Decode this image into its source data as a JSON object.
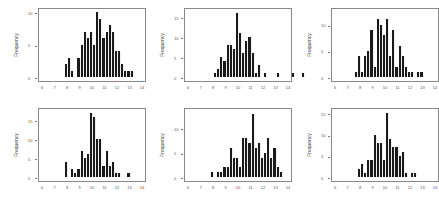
{
  "chart_data": [
    {
      "type": "bar",
      "title": "",
      "xlabel": "",
      "ylabel": "Frequency",
      "xlim": [
        6,
        14
      ],
      "ylim": [
        0,
        10.5
      ],
      "x_ticks": [
        "6",
        "7",
        "8",
        "9",
        "10",
        "11",
        "12",
        "13",
        "14"
      ],
      "y_ticks": [
        "0",
        "5",
        "10"
      ],
      "bin_width": 0.25,
      "bin_start": 7.75,
      "values": [
        2,
        3,
        1,
        0,
        3,
        5,
        7,
        6,
        7,
        5,
        10,
        9,
        6,
        7,
        8,
        7,
        4,
        4,
        2,
        1,
        1,
        1
      ],
      "grid": false
    },
    {
      "type": "bar",
      "title": "",
      "xlabel": "",
      "ylabel": "Frequency",
      "xlim": [
        6,
        14
      ],
      "ylim": [
        0,
        17
      ],
      "x_ticks": [
        "6",
        "7",
        "8",
        "9",
        "10",
        "11",
        "12",
        "13",
        "14"
      ],
      "y_ticks": [
        "0",
        "5",
        "10",
        "15"
      ],
      "bin_width": 0.25,
      "bin_start": 8.0,
      "values": [
        1,
        2,
        5,
        4,
        8,
        8,
        7,
        16,
        11,
        6,
        9,
        10,
        6,
        1,
        3,
        0,
        1,
        0,
        0,
        0,
        1,
        0,
        0,
        0,
        0,
        1,
        0,
        0,
        1
      ],
      "grid": false
    },
    {
      "type": "bar",
      "title": "",
      "xlabel": "",
      "ylabel": "Frequency",
      "xlim": [
        6,
        14
      ],
      "ylim": [
        0,
        13
      ],
      "x_ticks": [
        "6",
        "7",
        "8",
        "9",
        "10",
        "11",
        "12",
        "13",
        "14"
      ],
      "y_ticks": [
        "0",
        "5",
        "10"
      ],
      "bin_width": 0.25,
      "bin_start": 7.5,
      "values": [
        1,
        4,
        1,
        4,
        5,
        9,
        2,
        11,
        10,
        8,
        11,
        4,
        9,
        2,
        6,
        4,
        2,
        1,
        1,
        0,
        1,
        1
      ],
      "grid": false
    },
    {
      "type": "bar",
      "title": "",
      "xlabel": "",
      "ylabel": "Frequency",
      "xlim": [
        6,
        14
      ],
      "ylim": [
        0,
        18
      ],
      "x_ticks": [
        "6",
        "7",
        "8",
        "9",
        "10",
        "11",
        "12",
        "13",
        "14"
      ],
      "y_ticks": [
        "0",
        "5",
        "10",
        "15"
      ],
      "bin_width": 0.25,
      "bin_start": 7.75,
      "values": [
        4,
        0,
        2,
        1,
        2,
        7,
        5,
        6,
        17,
        16,
        10,
        10,
        3,
        7,
        3,
        4,
        1,
        1,
        0,
        0,
        1
      ],
      "grid": false
    },
    {
      "type": "bar",
      "title": "",
      "xlabel": "",
      "ylabel": "Frequency",
      "xlim": [
        6,
        14
      ],
      "ylim": [
        0,
        14
      ],
      "x_ticks": [
        "6",
        "7",
        "8",
        "9",
        "10",
        "11",
        "12",
        "13",
        "14"
      ],
      "y_ticks": [
        "0",
        "5",
        "10"
      ],
      "bin_width": 0.25,
      "bin_start": 7.75,
      "values": [
        1,
        0,
        1,
        1,
        2,
        2,
        6,
        4,
        4,
        2,
        8,
        8,
        7,
        13,
        6,
        7,
        4,
        5,
        8,
        4,
        6,
        2,
        1
      ],
      "grid": false
    },
    {
      "type": "bar",
      "title": "",
      "xlabel": "",
      "ylabel": "Frequency",
      "xlim": [
        6,
        14
      ],
      "ylim": [
        0,
        16
      ],
      "x_ticks": [
        "6",
        "7",
        "8",
        "9",
        "10",
        "11",
        "12",
        "13",
        "14"
      ],
      "y_ticks": [
        "0",
        "5",
        "10",
        "15"
      ],
      "bin_width": 0.25,
      "bin_start": 7.75,
      "values": [
        2,
        3,
        1,
        4,
        4,
        10,
        8,
        8,
        4,
        15,
        9,
        7,
        7,
        5,
        6,
        1,
        0,
        1,
        1
      ],
      "grid": false
    }
  ],
  "layout": {
    "rows": 2,
    "cols": 3,
    "bar_color": "#1a1a1a",
    "axis_color": "#777777"
  }
}
